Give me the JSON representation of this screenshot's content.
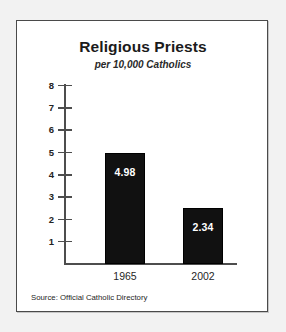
{
  "chart_data": {
    "type": "bar",
    "title": "Religious Priests",
    "subtitle": "per 10,000 Catholics",
    "xlabel": "",
    "ylabel": "",
    "categories": [
      "1965",
      "2002"
    ],
    "values": [
      4.98,
      2.34
    ],
    "value_labels": [
      "4.98",
      "2.34"
    ],
    "ylim": [
      0,
      8
    ],
    "yticks": [
      8,
      7,
      6,
      5,
      4,
      3,
      2,
      1
    ],
    "ytick_labels": [
      "8",
      "7",
      "6",
      "5",
      "4",
      "3",
      "2",
      "1"
    ],
    "grid": false,
    "legend": false,
    "bar_color": "#111111",
    "value_label_color": "#ffffff",
    "axis_color": "#4d4d4d",
    "source": "Source: Official Catholic Directory"
  },
  "figure": {
    "border_color": "#4a4a4a",
    "background": "#ffffff",
    "page_background": "#f2f2f2"
  }
}
